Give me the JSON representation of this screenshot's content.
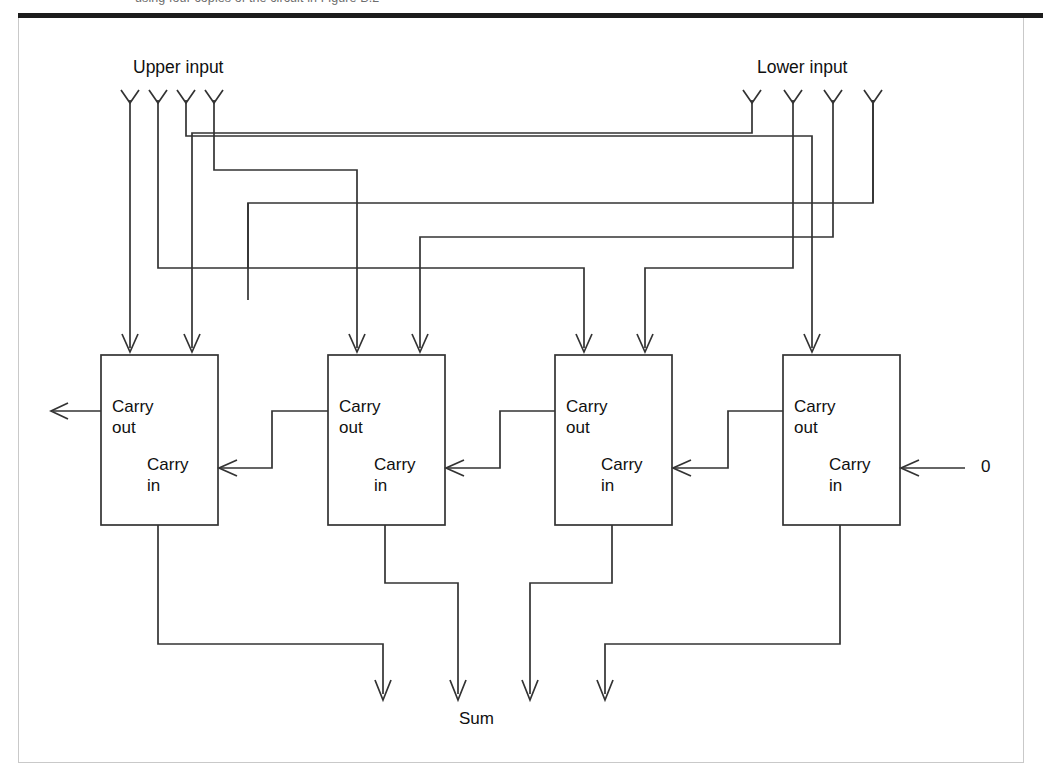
{
  "caption": {
    "text": "using four copies of the circuit in Figure B.2"
  },
  "figure": {
    "labels": {
      "upper_input": "Upper input",
      "lower_input": "Lower input",
      "sum": "Sum",
      "carry_in_constant": "0",
      "carry_out": "Carry\nout",
      "carry_in": "Carry\nin"
    },
    "adders": [
      {
        "id": "adder-0",
        "carry_out": "Carry",
        "carry_out_2": "out",
        "carry_in": "Carry",
        "carry_in_2": "in"
      },
      {
        "id": "adder-1",
        "carry_out": "Carry",
        "carry_out_2": "out",
        "carry_in": "Carry",
        "carry_in_2": "in"
      },
      {
        "id": "adder-2",
        "carry_out": "Carry",
        "carry_out_2": "out",
        "carry_in": "Carry",
        "carry_in_2": "in"
      },
      {
        "id": "adder-3",
        "carry_out": "Carry",
        "carry_out_2": "out",
        "carry_in": "Carry",
        "carry_in_2": "in"
      }
    ],
    "colors": {
      "line": "#333333",
      "rule": "#1c1c1c",
      "frame": "#c9c9c9",
      "text": "#101010",
      "background": "#ffffff"
    },
    "counts": {
      "upper_input_bits": 4,
      "lower_input_bits": 4,
      "sum_bits": 4,
      "adder_stages": 4
    }
  }
}
